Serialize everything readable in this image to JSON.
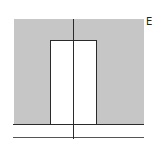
{
  "diagram": {
    "type": "potential-well",
    "axis_label": "E",
    "colors": {
      "barrier_fill": "#c6c6c6",
      "well_fill": "#ffffff",
      "line": "#2a2a2a"
    },
    "regions": [
      {
        "name": "left-barrier",
        "fill": "shaded"
      },
      {
        "name": "well",
        "fill": "white"
      },
      {
        "name": "right-barrier",
        "fill": "shaded"
      }
    ]
  }
}
